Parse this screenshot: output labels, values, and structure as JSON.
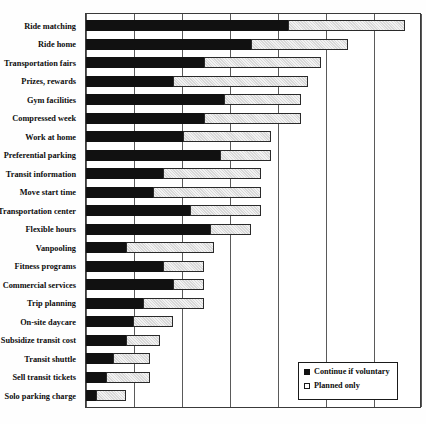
{
  "chart_data": {
    "type": "bar",
    "orientation": "horizontal",
    "stacked": true,
    "title": "",
    "xlabel": "",
    "ylabel": "",
    "xlim": [
      0,
      100
    ],
    "grid": true,
    "gridlines_x": [
      0,
      14.3,
      28.6,
      42.9,
      57.1,
      71.4,
      85.7,
      100
    ],
    "legend_position": "bottom-right",
    "categories": [
      "Ride matching",
      "Ride home",
      "Transportation fairs",
      "Prizes, rewards",
      "Gym facilities",
      "Compressed week",
      "Work at home",
      "Preferential parking",
      "Transit information",
      "Move start time",
      "Transportation center",
      "Flexible hours",
      "Vanpooling",
      "Fitness programs",
      "Commercial services",
      "Trip planning",
      "On-site daycare",
      "Subsidize transit cost",
      "Transit shuttle",
      "Sell transit tickets",
      "Solo parking charge"
    ],
    "series": [
      {
        "name": "Continue if voluntary",
        "color": "#111111",
        "values": [
          60,
          49,
          35,
          26,
          41,
          35,
          29,
          40,
          23,
          20,
          31,
          37,
          12,
          23,
          26,
          17,
          14,
          12,
          8,
          6,
          3
        ]
      },
      {
        "name": "Planned only",
        "color": "#e6e6e6",
        "values": [
          35,
          29,
          35,
          40,
          23,
          29,
          26,
          15,
          29,
          32,
          21,
          12,
          26,
          12,
          9,
          18,
          12,
          10,
          11,
          13,
          9
        ]
      }
    ],
    "totals": [
      95,
      78,
      70,
      66,
      64,
      64,
      55,
      55,
      52,
      52,
      52,
      49,
      38,
      35,
      35,
      35,
      26,
      22,
      19,
      19,
      12
    ]
  },
  "legend": {
    "items": [
      {
        "label": "Continue if voluntary",
        "swatch": "dark"
      },
      {
        "label": "Planned only",
        "swatch": "light"
      }
    ]
  }
}
